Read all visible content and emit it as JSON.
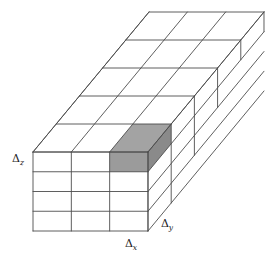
{
  "figure": {
    "type": "3d-grid-diagram",
    "background_color": "#ffffff",
    "line_color": "#4d4d4d",
    "line_width": 0.9,
    "labels": [
      {
        "id": "delta-z",
        "symbol": "Δ",
        "subscript": "z",
        "text": "Δz",
        "x": 18,
        "y": 162,
        "anchor": "middle",
        "describes": "vertical cell height"
      },
      {
        "id": "delta-x",
        "symbol": "Δ",
        "subscript": "x",
        "text": "Δx",
        "x": 131,
        "y": 247,
        "anchor": "middle",
        "describes": "horizontal cell width along front face"
      },
      {
        "id": "delta-y",
        "symbol": "Δ",
        "subscript": "y",
        "text": "Δy",
        "x": 167,
        "y": 227,
        "anchor": "middle",
        "describes": "cell depth along receding axis"
      }
    ]
  },
  "chart_data": {
    "type": "diagram",
    "grid": {
      "nx": 3,
      "ny": 5,
      "nz": 4,
      "front_face_origin": {
        "x": 33,
        "y": 152
      },
      "cell_width_px": 38.33,
      "cell_height_px": 19.75,
      "depth_step_px": {
        "dx": 23.2,
        "dy": -28.0
      }
    },
    "highlighted_cell": {
      "ix": 2,
      "iy": 0,
      "iz": 0,
      "label": "control volume",
      "top_fill": "#a3a3a3",
      "front_fill": "#9b9b9b",
      "side_fill": "#8a8a8a"
    },
    "axis_labels": [
      "Δx",
      "Δy",
      "Δz"
    ]
  }
}
